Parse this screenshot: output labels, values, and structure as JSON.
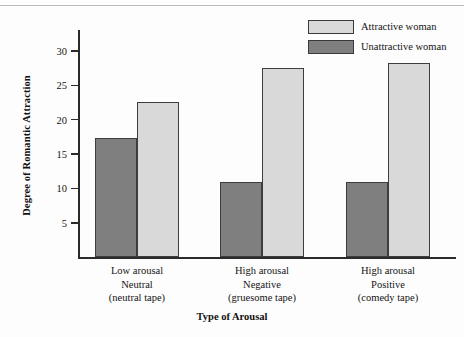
{
  "chart_data": {
    "type": "bar",
    "title": "",
    "xlabel": "Type of Arousal",
    "ylabel": "Degree of Romantic Attraction",
    "ylim": [
      0,
      33
    ],
    "yticks": [
      5,
      10,
      15,
      20,
      25,
      30
    ],
    "grid": false,
    "legend_position": "top-right",
    "categories": [
      "Low arousal\nNeutral\n(neutral tape)",
      "High arousal\nNegative\n(gruesome tape)",
      "High arousal\nPositive\n(comedy tape)"
    ],
    "category_lines": [
      [
        "Low arousal",
        "Neutral",
        "(neutral tape)"
      ],
      [
        "High arousal",
        "Negative",
        "(gruesome tape)"
      ],
      [
        "High arousal",
        "Positive",
        "(comedy tape)"
      ]
    ],
    "series": [
      {
        "name": "Unattractive woman",
        "color": "#7f7f7f",
        "values": [
          17.4,
          11.0,
          11.0
        ]
      },
      {
        "name": "Attractive woman",
        "color": "#d9d9d9",
        "values": [
          22.5,
          27.5,
          28.3
        ]
      }
    ],
    "series_draw_order": [
      "Unattractive woman",
      "Attractive woman"
    ]
  },
  "legend": {
    "items": [
      {
        "label": "Attractive woman",
        "color": "#d9d9d9"
      },
      {
        "label": "Unattractive woman",
        "color": "#7f7f7f"
      }
    ]
  },
  "axes": {
    "y_title": "Degree of Romantic Attraction",
    "x_title": "Type of Arousal",
    "y_tick_labels": [
      "30",
      "25",
      "20",
      "15",
      "10",
      "5"
    ]
  },
  "colors": {
    "bar_dark": "#7f7f7f",
    "bar_light": "#d9d9d9",
    "axis": "#2b2b2b",
    "text": "#141414",
    "background": "#fdfdfd"
  }
}
